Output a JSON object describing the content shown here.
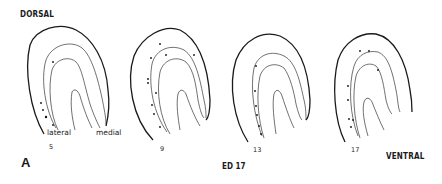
{
  "figure": {
    "panel_label": "A",
    "orientation_top": "DORSAL",
    "orientation_bottom": "VENTRAL",
    "stage_label": "ED 17",
    "annotations": {
      "lateral": "lateral",
      "medial": "medial"
    },
    "sections": [
      {
        "number": "5",
        "labeled_dots": 5
      },
      {
        "number": "9",
        "labeled_dots": 11
      },
      {
        "number": "13",
        "labeled_dots": 6
      },
      {
        "number": "17",
        "labeled_dots": 9
      }
    ],
    "colors": {
      "ink": "#1a1a1a",
      "background": "#ffffff"
    }
  }
}
